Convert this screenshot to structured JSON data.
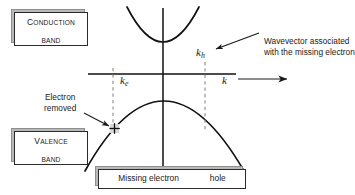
{
  "figure": {
    "type": "band-structure-diagram",
    "title_caption": {
      "text_before": "Missing electron",
      "arrow_glyph": "double-dashed-arrow",
      "text_after": "hole"
    },
    "boxes": [
      {
        "id": "conduction",
        "line1_lead": "C",
        "line1_rest": "onduction",
        "line2": "band"
      },
      {
        "id": "valence",
        "line1_lead": "V",
        "line1_rest": "alence",
        "line2": "band"
      }
    ],
    "annotations": [
      {
        "id": "wavevector-note",
        "line1": "Wavevector associated",
        "line2": "with the missing electron"
      },
      {
        "id": "electron-removed-note",
        "line1": "Electron",
        "line2": "removed"
      }
    ],
    "axis_labels": {
      "k_axis": {
        "symbol": "k",
        "sub": "",
        "arrow": "⟶"
      },
      "k_e": {
        "symbol": "k",
        "sub": "e"
      },
      "k_h": {
        "symbol": "k",
        "sub": "h"
      }
    },
    "markers": [
      {
        "id": "hole-marker",
        "glyph": "plus-cross",
        "x": 114,
        "y": 128
      }
    ],
    "colors": {
      "ink": "#1a1a1a",
      "curve": "#111111",
      "dashed": "#777777",
      "box_shadow": "#8f8f8f",
      "background": "#ffffff"
    },
    "geometry": {
      "origin": {
        "x": 163,
        "y": 74
      },
      "x_axis": {
        "x1": 88,
        "x2": 236,
        "y": 74
      },
      "y_axis": {
        "x": 163,
        "y1": 8,
        "y2": 170
      },
      "k_arrow": {
        "x1": 238,
        "x2": 291,
        "y": 79
      },
      "dashed_left_x": 113,
      "dashed_right_x": 205,
      "conduction_curve": {
        "vertex_x": 163,
        "vertex_y": 43,
        "left_x": 128,
        "left_y": 8,
        "right_x": 200,
        "right_y": 8
      },
      "valence_curve": {
        "vertex_x": 163,
        "vertex_y": 100,
        "left_x": 85,
        "left_y": 170,
        "right_x": 244,
        "right_y": 170
      }
    }
  }
}
